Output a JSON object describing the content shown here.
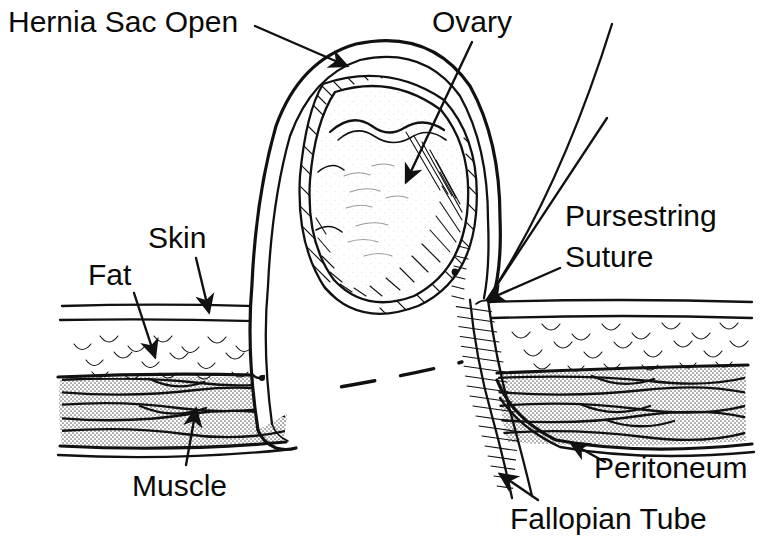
{
  "figure": {
    "title": "Hernia Sac Open",
    "kind": "anatomical-line-illustration",
    "background_color": "#ffffff",
    "ink_color": "#111111",
    "muscle_fill_color": "#d4d4d4",
    "width": 768,
    "height": 555
  },
  "labels": {
    "hernia_sac_open": "Hernia Sac Open",
    "ovary": "Ovary",
    "pursestring": "Pursestring",
    "suture": "Suture",
    "skin": "Skin",
    "fat": "Fat",
    "muscle": "Muscle",
    "peritoneum": "Peritoneum",
    "fallopian_tube": "Fallopian Tube"
  },
  "annotations": [
    {
      "id": "hernia-sac-open",
      "text": "Hernia Sac Open",
      "text_x": 8,
      "text_y": 32,
      "anchor": "start",
      "leader_from": [
        255,
        26
      ],
      "leader_to": [
        347,
        66
      ],
      "has_arrow": true
    },
    {
      "id": "ovary",
      "text": "Ovary",
      "text_x": 432,
      "text_y": 32,
      "anchor": "start",
      "leader_from": [
        472,
        42
      ],
      "leader_to": [
        406,
        182
      ],
      "has_arrow": true
    },
    {
      "id": "pursestring",
      "text": "Pursestring",
      "text_x": 565,
      "text_y": 226,
      "anchor": "start",
      "leader_from": [
        560,
        268
      ],
      "leader_to": [
        487,
        300
      ],
      "has_arrow": true
    },
    {
      "id": "suture",
      "text": "Suture",
      "text_x": 565,
      "text_y": 266,
      "anchor": "start",
      "leader_from": null,
      "leader_to": null,
      "has_arrow": false
    },
    {
      "id": "skin",
      "text": "Skin",
      "text_x": 148,
      "text_y": 248,
      "anchor": "start",
      "leader_from": [
        196,
        258
      ],
      "leader_to": [
        209,
        312
      ],
      "has_arrow": true
    },
    {
      "id": "fat",
      "text": "Fat",
      "text_x": 88,
      "text_y": 285,
      "anchor": "start",
      "leader_from": [
        134,
        293
      ],
      "leader_to": [
        155,
        357
      ],
      "has_arrow": true
    },
    {
      "id": "muscle",
      "text": "Muscle",
      "text_x": 132,
      "text_y": 496,
      "anchor": "start",
      "leader_from": [
        186,
        465
      ],
      "leader_to": [
        196,
        409
      ],
      "has_arrow": true
    },
    {
      "id": "peritoneum",
      "text": "Peritoneum",
      "text_x": 594,
      "text_y": 478,
      "anchor": "start",
      "leader_from": [
        605,
        462
      ],
      "leader_to": [
        571,
        443
      ],
      "has_arrow": true
    },
    {
      "id": "fallopian-tube",
      "text": "Fallopian Tube",
      "text_x": 510,
      "text_y": 528,
      "anchor": "start",
      "leader_from": [
        538,
        500
      ],
      "leader_to": [
        500,
        474
      ],
      "has_arrow": true
    }
  ],
  "structures": [
    {
      "id": "skin-layer",
      "name": "Skin",
      "description": "Two thin parallel lines across left and right abdominal wall"
    },
    {
      "id": "fat-layer",
      "name": "Fat",
      "description": "Band of scalloped crescent marks between skin and muscle"
    },
    {
      "id": "muscle-layer",
      "name": "Muscle",
      "description": "Stippled grey band with horizontal fibre strokes"
    },
    {
      "id": "peritoneum-line",
      "name": "Peritoneum",
      "description": "Deep bounding line under the muscle layer"
    },
    {
      "id": "hernia-sac",
      "name": "Hernia Sac Open",
      "description": "Large opened sac arching up from the abdominal wall defect"
    },
    {
      "id": "ovary",
      "name": "Ovary",
      "description": "Ovoid stippled/hatched organ inside the opened sac"
    },
    {
      "id": "fallopian-tube",
      "name": "Fallopian Tube",
      "description": "Hatched tubular structure descending to lower right"
    },
    {
      "id": "pursestring-suture",
      "name": "Pursestring Suture",
      "description": "Two suture strands converging at the sac neck"
    },
    {
      "id": "incision-dashes",
      "name": "Incision line",
      "description": "Two dashed lines across the open defect"
    }
  ]
}
